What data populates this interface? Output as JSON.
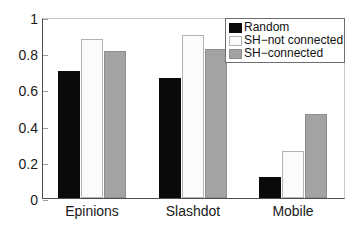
{
  "chart_data": {
    "type": "bar",
    "title": "",
    "subtitle": "",
    "xlabel": "",
    "ylabel": "",
    "categories": [
      "Epinions",
      "Slashdot",
      "Mobile"
    ],
    "series": [
      {
        "name": "Random",
        "color": "#0a0a0a",
        "values": [
          0.71,
          0.67,
          0.12
        ]
      },
      {
        "name": "SH−not connected",
        "color": "#fbfbfb",
        "values": [
          0.89,
          0.91,
          0.26
        ]
      },
      {
        "name": "SH−connected",
        "color": "#a3a3a3",
        "values": [
          0.82,
          0.83,
          0.47
        ]
      }
    ],
    "ylim": [
      0,
      1
    ],
    "yticks": [
      "0",
      "0.2",
      "0.4",
      "0.6",
      "0.8",
      "1"
    ],
    "ytick_values": [
      0,
      0.2,
      0.4,
      0.6,
      0.8,
      1
    ],
    "grid": false,
    "legend_position": "top-right"
  },
  "legend": {
    "items": [
      {
        "label": "Random"
      },
      {
        "label": "SH−not connected"
      },
      {
        "label": "SH−connected"
      }
    ]
  },
  "axes": {
    "y_tick_labels": [
      "0",
      "0.2",
      "0.4",
      "0.6",
      "0.8",
      "1"
    ],
    "x_tick_labels": [
      "Epinions",
      "Slashdot",
      "Mobile"
    ]
  }
}
